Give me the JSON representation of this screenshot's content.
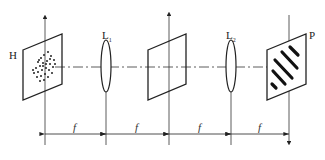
{
  "diagram": {
    "labels": {
      "hologram_plane": "H",
      "lens1": "L",
      "lens1_sub": "1",
      "lens2": "L",
      "lens2_sub": "2",
      "output_plane": "P"
    },
    "dimensions": [
      {
        "label": "f",
        "from": "H",
        "to": "L1"
      },
      {
        "label": "f",
        "from": "L1",
        "to": "Fourier plane"
      },
      {
        "label": "f",
        "from": "Fourier plane",
        "to": "L2"
      },
      {
        "label": "f",
        "from": "L2",
        "to": "P"
      }
    ],
    "colors": {
      "stroke": "#222222",
      "background": "#ffffff"
    }
  }
}
